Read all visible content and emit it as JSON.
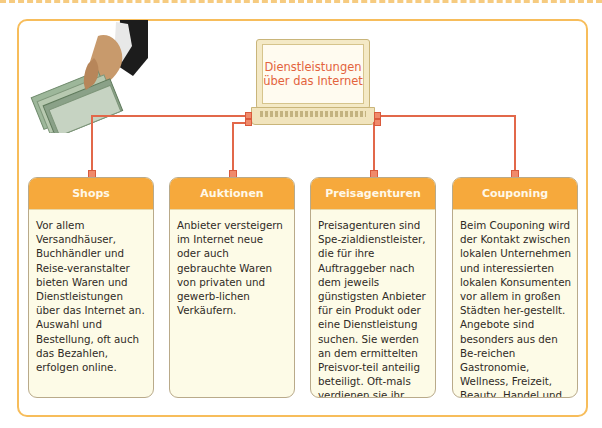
{
  "center": {
    "title": "Dienstleistungen über das Internet"
  },
  "image": {
    "icon": "hand-with-euro-banknotes"
  },
  "colors": {
    "frame": "#f7bd5b",
    "connector": "#e2684a",
    "card_header": "#f6a93c",
    "card_body": "#fdfbe7",
    "title_text": "#e3633d"
  },
  "cards": [
    {
      "title": "Shops",
      "text": "Vor allem Versandhäuser, Buchhändler und Reise-veranstalter bieten Waren und Dienstleistungen über das Internet an. Auswahl und Bestellung, oft auch das Bezahlen, erfolgen online."
    },
    {
      "title": "Auktionen",
      "text": "Anbieter versteigern im Internet neue oder auch gebrauchte Waren von privaten und gewerb-lichen Verkäufern."
    },
    {
      "title": "Preisagenturen",
      "text": "Preisagenturen sind Spe-zialdienstleister, die für ihre Auftraggeber nach dem jeweils günstigsten Anbieter für ein Produkt oder eine Dienstleistung suchen. Sie werden an dem ermittelten Preisvor-teil anteilig beteiligt. Oft-mals verdienen sie ihr Geld jedoch mit der Vermittlung von Kunden an die Anbieter."
    },
    {
      "title": "Couponing",
      "text": "Beim Couponing wird der Kontakt zwischen lokalen Unternehmen und interessierten lokalen Konsumenten vor allem in großen Städten her-gestellt. Angebote sind besonders aus den Be-reichen Gastronomie, Wellness, Freizeit, Beauty, Handel und Reisen."
    }
  ]
}
